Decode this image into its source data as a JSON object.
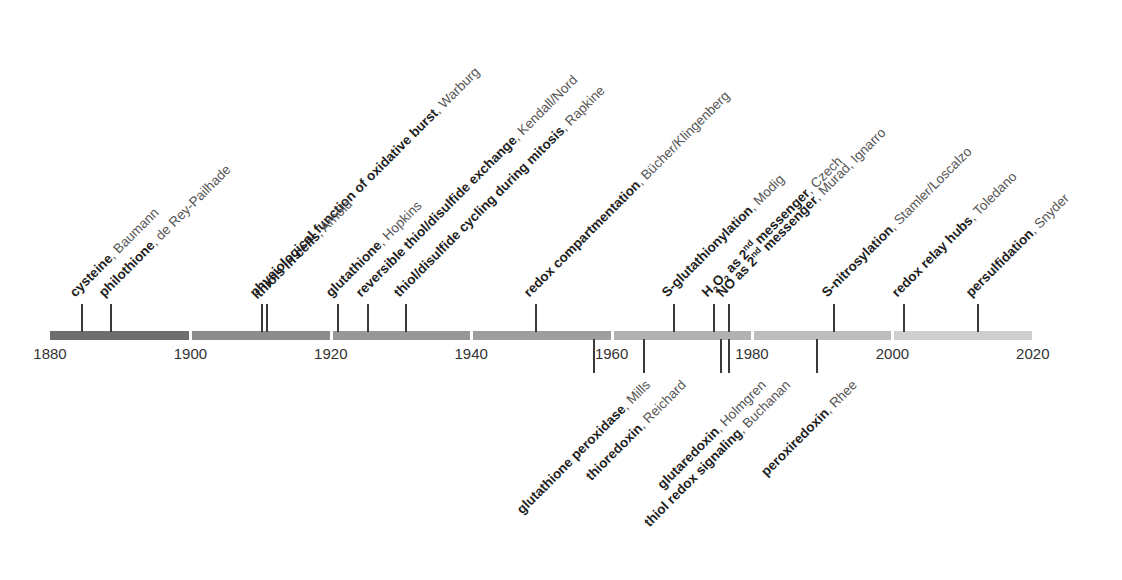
{
  "axis": {
    "start_year": 1880,
    "end_year": 2020,
    "px_per_year": 7.02,
    "origin_x": 50,
    "segments": [
      {
        "from": 1880,
        "to": 1900,
        "color": "#6e6e6e"
      },
      {
        "from": 1900,
        "to": 1920,
        "color": "#8c8c8c"
      },
      {
        "from": 1920,
        "to": 1940,
        "color": "#979797"
      },
      {
        "from": 1940,
        "to": 1960,
        "color": "#9e9e9e"
      },
      {
        "from": 1960,
        "to": 1980,
        "color": "#b1b1b1"
      },
      {
        "from": 1980,
        "to": 2000,
        "color": "#bdbdbd"
      },
      {
        "from": 2000,
        "to": 2020,
        "color": "#cfcfcf"
      }
    ],
    "tick_labels": [
      "1880",
      "1900",
      "1920",
      "1940",
      "1960",
      "1980",
      "2000",
      "2020"
    ]
  },
  "events_above": [
    {
      "x": 81,
      "topic": "cysteine",
      "author": "Baumann"
    },
    {
      "x": 110,
      "topic": "philothione",
      "author": "de Rey-Pailhade"
    },
    {
      "x": 261,
      "topic": "physiological function of oxidative burst",
      "author": "Warburg"
    },
    {
      "x": 266,
      "topic": "thiols in cells",
      "author": "Arnold"
    },
    {
      "x": 337,
      "topic": "glutathione",
      "author": "Hopkins"
    },
    {
      "x": 367,
      "topic": "reversible thiol/disulfide exchange",
      "author": "Kendall/Nord"
    },
    {
      "x": 405,
      "topic": "thiol/disulfide cycling during mitosis",
      "author": "Rapkine"
    },
    {
      "x": 535,
      "topic": "redox compartmentation",
      "author": "Bücher/Klingenberg"
    },
    {
      "x": 673,
      "topic": "S-glutathionylation",
      "author": "Modig"
    },
    {
      "x": 713,
      "topic": "H2O2 as 2nd messenger",
      "author": "Czech",
      "rich": "h2o2"
    },
    {
      "x": 728,
      "topic": "NO as 2nd messenger",
      "author": "Murad, Ignarro",
      "rich": "no"
    },
    {
      "x": 833,
      "topic": "S-nitrosylation",
      "author": "Stamler/Loscalzo"
    },
    {
      "x": 903,
      "topic": "redox relay hubs",
      "author": "Toledano"
    },
    {
      "x": 977,
      "topic": "persulfidation",
      "author": "Snyder"
    }
  ],
  "events_below": [
    {
      "x": 593,
      "topic": "glutathione peroxidase",
      "author": "Mills"
    },
    {
      "x": 643,
      "topic": "thioredoxin",
      "author": "Reichard"
    },
    {
      "x": 720,
      "topic": "glutaredoxin",
      "author": "Holmgren"
    },
    {
      "x": 728,
      "topic": "thiol redox signaling",
      "author": "Buchanan"
    },
    {
      "x": 816,
      "topic": "peroxiredoxin",
      "author": "Rhee"
    }
  ],
  "chart_data": {
    "type": "timeline",
    "title": "",
    "x_range": [
      1880,
      2020
    ],
    "tick_labels": [
      1880,
      1900,
      1920,
      1940,
      1960,
      1980,
      2000,
      2020
    ],
    "events": [
      {
        "year": 1884,
        "side": "above",
        "topic": "cysteine",
        "author": "Baumann"
      },
      {
        "year": 1888,
        "side": "above",
        "topic": "philothione",
        "author": "de Rey-Pailhade"
      },
      {
        "year": 1909,
        "side": "above",
        "topic": "physiological function of oxidative burst",
        "author": "Warburg"
      },
      {
        "year": 1910,
        "side": "above",
        "topic": "thiols in cells",
        "author": "Arnold"
      },
      {
        "year": 1921,
        "side": "above",
        "topic": "glutathione",
        "author": "Hopkins"
      },
      {
        "year": 1925,
        "side": "above",
        "topic": "reversible thiol/disulfide exchange",
        "author": "Kendall/Nord"
      },
      {
        "year": 1930,
        "side": "above",
        "topic": "thiol/disulfide cycling during mitosis",
        "author": "Rapkine"
      },
      {
        "year": 1949,
        "side": "above",
        "topic": "redox compartmentation",
        "author": "Bücher/Klingenberg"
      },
      {
        "year": 1957,
        "side": "below",
        "topic": "glutathione peroxidase",
        "author": "Mills"
      },
      {
        "year": 1964,
        "side": "below",
        "topic": "thioredoxin",
        "author": "Reichard"
      },
      {
        "year": 1968,
        "side": "above",
        "topic": "S-glutathionylation",
        "author": "Modig"
      },
      {
        "year": 1974,
        "side": "above",
        "topic": "H2O2 as 2nd messenger",
        "author": "Czech"
      },
      {
        "year": 1975,
        "side": "below",
        "topic": "glutaredoxin",
        "author": "Holmgren"
      },
      {
        "year": 1976,
        "side": "above",
        "topic": "NO as 2nd messenger",
        "author": "Murad, Ignarro"
      },
      {
        "year": 1976,
        "side": "below",
        "topic": "thiol redox signaling",
        "author": "Buchanan"
      },
      {
        "year": 1989,
        "side": "below",
        "topic": "peroxiredoxin",
        "author": "Rhee"
      },
      {
        "year": 1992,
        "side": "above",
        "topic": "S-nitrosylation",
        "author": "Stamler/Loscalzo"
      },
      {
        "year": 2002,
        "side": "above",
        "topic": "redox relay hubs",
        "author": "Toledano"
      },
      {
        "year": 2012,
        "side": "above",
        "topic": "persulfidation",
        "author": "Snyder"
      }
    ]
  }
}
